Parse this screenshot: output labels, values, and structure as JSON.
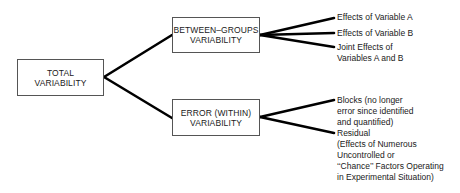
{
  "diagram": {
    "root": {
      "lines": [
        "TOTAL",
        "VARIABILITY"
      ]
    },
    "branches": [
      {
        "lines": [
          "BETWEEN–GROUPS",
          "VARIABILITY"
        ],
        "leaves": [
          {
            "lines": [
              "Effects of Variable A"
            ]
          },
          {
            "lines": [
              "Effects of Variable B"
            ]
          },
          {
            "lines": [
              "Joint Effects of",
              "Variables A and B"
            ]
          }
        ]
      },
      {
        "lines": [
          "ERROR (WITHIN)",
          "VARIABILITY"
        ],
        "leaves": [
          {
            "lines": [
              "Blocks (no longer",
              "error since identified",
              "and quantified)"
            ]
          },
          {
            "lines": [
              "Residual",
              "(Effects of Numerous",
              "Uncontrolled or",
              "‘‘Chance’’ Factors Operating",
              "in Experimental Situation)"
            ]
          }
        ]
      }
    ],
    "colors": {
      "line": "#000000",
      "box_border": "#555555",
      "text": "#1a1a1a"
    }
  }
}
